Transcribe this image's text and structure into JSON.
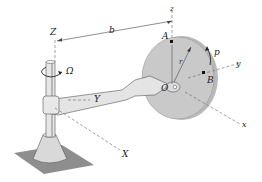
{
  "diagram": {
    "labels": {
      "Z": "Z",
      "z": "z",
      "b": "b",
      "A": "A",
      "p": "p",
      "y": "y",
      "B": "B",
      "r": "r",
      "O": "O",
      "Omega": "Ω",
      "Y": "Y",
      "X": "X",
      "x": "x"
    },
    "colors": {
      "disk_fill": "#c8c8c8",
      "disk_edge": "#a9a9a9",
      "base_plate": "#8e8e8e",
      "base_cone": "#d6d6d6",
      "arm": "#e2e2e2",
      "line": "#333333"
    }
  }
}
